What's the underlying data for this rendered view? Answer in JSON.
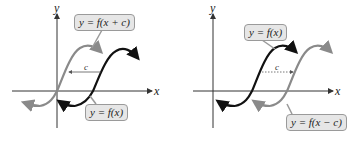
{
  "left_panel": {
    "y_axis_label": "y",
    "x_axis_label": "x",
    "shift_label": "c",
    "shift_direction": "left",
    "curves": [
      {
        "name": "shifted",
        "label": "y = f(x + c)",
        "color": "#8a8a8a"
      },
      {
        "name": "original",
        "label": "y = f(x)",
        "color": "#111111"
      }
    ]
  },
  "right_panel": {
    "y_axis_label": "y",
    "x_axis_label": "x",
    "shift_label": "c",
    "shift_direction": "right",
    "curves": [
      {
        "name": "original",
        "label": "y = f(x)",
        "color": "#111111"
      },
      {
        "name": "shifted",
        "label": "y = f(x − c)",
        "color": "#8a8a8a"
      }
    ]
  },
  "colors": {
    "axis": "#333333",
    "label_bg": "#e6e6e6",
    "label_border": "#9a9a9a"
  }
}
